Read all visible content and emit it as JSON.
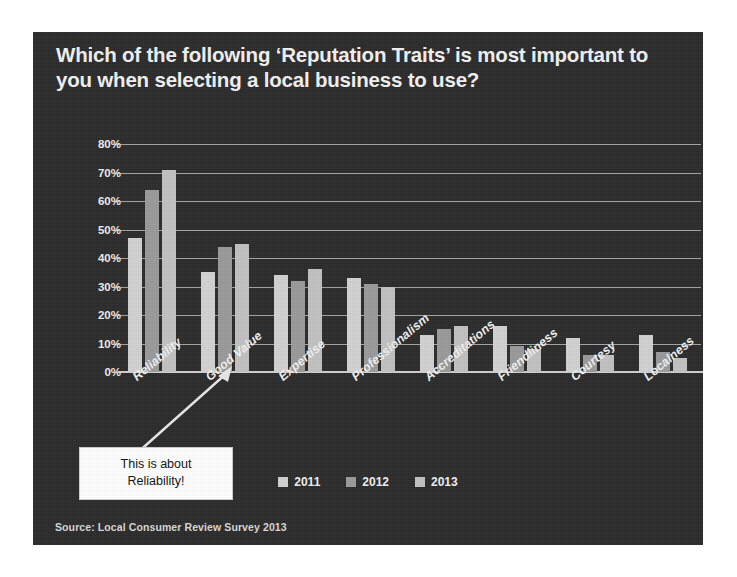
{
  "slide": {
    "title": "Which of the following ‘Reputation Traits’ is most important to you when selecting a local business to use?",
    "source": "Source: Local Consumer Review Survey 2013",
    "background_color": "#2b2b2b",
    "text_color": "#f2f2f2"
  },
  "callout": {
    "line1": "This is about",
    "line2": "Reliability!",
    "background_color": "#ffffff",
    "text_color": "#111111"
  },
  "chart_data": {
    "type": "bar",
    "title": "Which of the following ‘Reputation Traits’ is most important to you when selecting a local business to use?",
    "xlabel": "",
    "ylabel": "",
    "ylim": [
      0,
      80
    ],
    "ytick_labels": [
      "0%",
      "10%",
      "20%",
      "30%",
      "40%",
      "50%",
      "60%",
      "70%",
      "80%"
    ],
    "ytick_values": [
      0,
      10,
      20,
      30,
      40,
      50,
      60,
      70,
      80
    ],
    "grid": true,
    "legend_position": "bottom",
    "categories": [
      "Reliability",
      "Good Value",
      "Expertise",
      "Professionalism",
      "Accreditations",
      "Friendliness",
      "Courtesy",
      "Localness"
    ],
    "series": [
      {
        "name": "2011",
        "color": "#d2d2d2",
        "values": [
          47,
          35,
          34,
          33,
          13,
          16,
          12,
          13
        ]
      },
      {
        "name": "2012",
        "color": "#9a9a9a",
        "values": [
          64,
          44,
          32,
          31,
          15,
          9,
          6,
          7
        ]
      },
      {
        "name": "2013",
        "color": "#c2c2c2",
        "values": [
          71,
          45,
          36,
          30,
          16,
          8,
          6,
          5
        ]
      }
    ]
  }
}
